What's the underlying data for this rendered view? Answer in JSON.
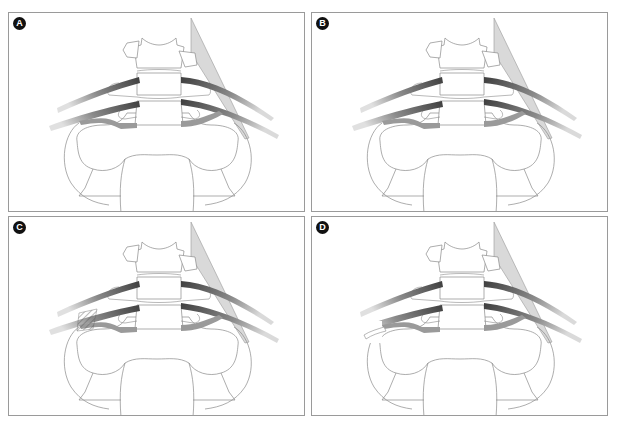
{
  "figure": {
    "type": "anatomical illustration",
    "layout": "2x2 grid",
    "panels": [
      {
        "id": "A",
        "label": "A",
        "variant": "baseline"
      },
      {
        "id": "B",
        "label": "B",
        "variant": "baseline"
      },
      {
        "id": "C",
        "label": "C",
        "variant": "hatched-compression"
      },
      {
        "id": "D",
        "label": "D",
        "variant": "rib-resection"
      }
    ],
    "colors": {
      "outline": "#8a8a8a",
      "border": "#9a9a9a",
      "vessel_dark": "#4a4a4a",
      "vessel_mid": "#7a7a7a",
      "vessel_light": "#c8c8c8",
      "triangle_fill": "#d9d9d9",
      "badge_bg": "#111111",
      "badge_fg": "#ffffff"
    }
  }
}
